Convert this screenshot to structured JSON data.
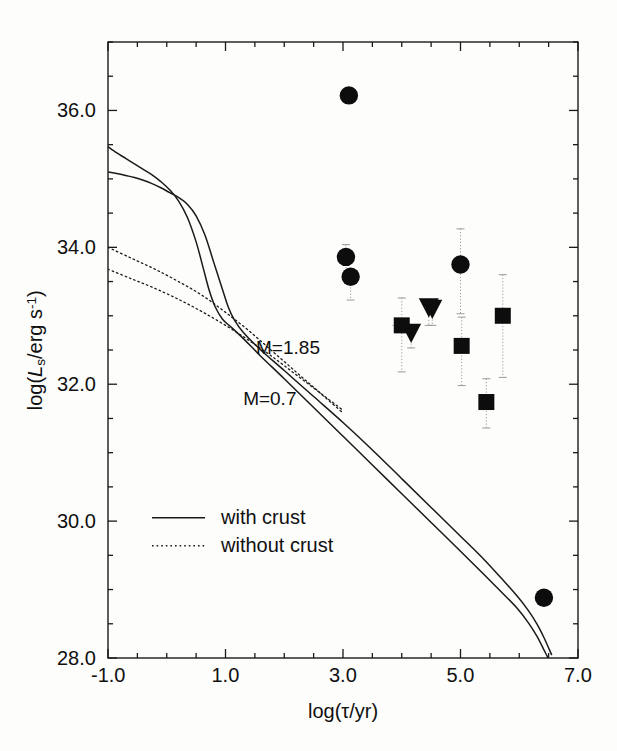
{
  "figure": {
    "background": "#fdfdfc",
    "ink": "#1a1a1a"
  },
  "axes": {
    "x_title": "log(τ/yr)",
    "y_title_prefix": "log(",
    "y_title_var": "L",
    "y_title_sub": "s",
    "y_title_mid": "/erg s",
    "y_title_sup": "-1",
    "y_title_suffix": ")",
    "x_ticks": [
      "-1.0",
      "1.0",
      "3.0",
      "5.0",
      "7.0"
    ],
    "y_ticks": [
      "28.0",
      "30.0",
      "32.0",
      "34.0",
      "36.0"
    ],
    "xlim": [
      -1.0,
      7.0
    ],
    "ylim": [
      28.0,
      37.0
    ],
    "x_major_step": 2.0,
    "y_major_step": 2.0,
    "x_minor_step": 0.5,
    "y_minor_step": 0.5
  },
  "curve_labels": {
    "upper": "M=1.85",
    "lower": "M=0.7"
  },
  "legend": {
    "entries": [
      {
        "label": "with crust",
        "style": "solid"
      },
      {
        "label": "without crust",
        "style": "dotted"
      }
    ]
  },
  "chart_data": {
    "type": "line",
    "title": "",
    "xlabel": "log(τ/yr)",
    "ylabel": "log(L_s/erg s^-1)",
    "xlim": [
      -1.0,
      7.0
    ],
    "ylim": [
      28.0,
      37.0
    ],
    "grid": false,
    "legend_position": "lower-left",
    "series": [
      {
        "name": "M=1.85 with crust",
        "style": "solid",
        "points": [
          [
            -1.0,
            35.47
          ],
          [
            -0.85,
            35.38
          ],
          [
            -0.7,
            35.3
          ],
          [
            -0.55,
            35.22
          ],
          [
            -0.4,
            35.14
          ],
          [
            -0.25,
            35.06
          ],
          [
            -0.1,
            34.96
          ],
          [
            0.05,
            34.84
          ],
          [
            0.2,
            34.68
          ],
          [
            0.35,
            34.44
          ],
          [
            0.5,
            34.08
          ],
          [
            0.62,
            33.7
          ],
          [
            0.72,
            33.38
          ],
          [
            0.82,
            33.14
          ],
          [
            0.95,
            32.95
          ],
          [
            1.1,
            32.83
          ],
          [
            1.3,
            32.67
          ],
          [
            1.6,
            32.41
          ],
          [
            2.0,
            32.08
          ],
          [
            2.5,
            31.66
          ],
          [
            3.0,
            31.24
          ],
          [
            3.5,
            30.82
          ],
          [
            4.0,
            30.4
          ],
          [
            4.5,
            29.98
          ],
          [
            5.0,
            29.56
          ],
          [
            5.4,
            29.22
          ],
          [
            5.7,
            28.96
          ],
          [
            5.95,
            28.74
          ],
          [
            6.15,
            28.52
          ],
          [
            6.3,
            28.32
          ],
          [
            6.42,
            28.12
          ],
          [
            6.52,
            27.95
          ]
        ]
      },
      {
        "name": "M=0.7 with crust",
        "style": "solid",
        "points": [
          [
            -1.0,
            35.1
          ],
          [
            -0.85,
            35.08
          ],
          [
            -0.7,
            35.05
          ],
          [
            -0.55,
            35.02
          ],
          [
            -0.4,
            34.98
          ],
          [
            -0.25,
            34.93
          ],
          [
            -0.1,
            34.87
          ],
          [
            0.05,
            34.8
          ],
          [
            0.2,
            34.73
          ],
          [
            0.35,
            34.63
          ],
          [
            0.5,
            34.46
          ],
          [
            0.65,
            34.18
          ],
          [
            0.8,
            33.78
          ],
          [
            0.95,
            33.38
          ],
          [
            1.05,
            33.12
          ],
          [
            1.15,
            32.94
          ],
          [
            1.3,
            32.76
          ],
          [
            1.6,
            32.5
          ],
          [
            2.0,
            32.2
          ],
          [
            2.5,
            31.82
          ],
          [
            3.0,
            31.44
          ],
          [
            3.5,
            31.04
          ],
          [
            4.0,
            30.62
          ],
          [
            4.5,
            30.2
          ],
          [
            5.0,
            29.78
          ],
          [
            5.4,
            29.44
          ],
          [
            5.7,
            29.16
          ],
          [
            5.95,
            28.92
          ],
          [
            6.15,
            28.7
          ],
          [
            6.3,
            28.5
          ],
          [
            6.42,
            28.3
          ],
          [
            6.55,
            28.05
          ]
        ]
      },
      {
        "name": "M=1.85 without crust",
        "style": "dotted",
        "points": [
          [
            -1.0,
            34.0
          ],
          [
            -0.6,
            33.84
          ],
          [
            -0.2,
            33.68
          ],
          [
            0.2,
            33.5
          ],
          [
            0.6,
            33.3
          ],
          [
            1.0,
            33.05
          ],
          [
            1.4,
            32.78
          ],
          [
            1.8,
            32.48
          ],
          [
            2.2,
            32.18
          ],
          [
            2.6,
            31.88
          ],
          [
            3.0,
            31.58
          ]
        ]
      },
      {
        "name": "M=0.7 without crust",
        "style": "dotted",
        "points": [
          [
            -1.0,
            33.68
          ],
          [
            -0.6,
            33.54
          ],
          [
            -0.2,
            33.4
          ],
          [
            0.2,
            33.24
          ],
          [
            0.6,
            33.06
          ],
          [
            1.0,
            32.86
          ],
          [
            1.4,
            32.64
          ],
          [
            1.8,
            32.4
          ],
          [
            2.2,
            32.14
          ],
          [
            2.6,
            31.88
          ],
          [
            3.0,
            31.62
          ]
        ]
      }
    ],
    "observations": [
      {
        "marker": "circle",
        "x": 3.1,
        "y": 36.22,
        "yerr_lo": 0.1,
        "yerr_hi": 0.04,
        "xerr": 0.03
      },
      {
        "marker": "circle",
        "x": 3.05,
        "y": 33.86,
        "yerr_lo": 0.3,
        "yerr_hi": 0.18,
        "xerr": 0.1
      },
      {
        "marker": "circle",
        "x": 3.13,
        "y": 33.57,
        "yerr_lo": 0.34,
        "yerr_hi": 0.08,
        "xerr": 0.08
      },
      {
        "marker": "circle",
        "x": 5.0,
        "y": 33.75,
        "yerr_lo": 0.72,
        "yerr_hi": 0.52,
        "xerr": 0.06
      },
      {
        "marker": "square",
        "x": 4.0,
        "y": 32.86,
        "yerr_lo": 0.68,
        "yerr_hi": 0.4,
        "xerr": 0.16
      },
      {
        "marker": "square",
        "x": 5.02,
        "y": 32.56,
        "yerr_lo": 0.58,
        "yerr_hi": 0.42,
        "xerr": 0.1
      },
      {
        "marker": "square",
        "x": 5.72,
        "y": 33.0,
        "yerr_lo": 0.9,
        "yerr_hi": 0.6,
        "xerr": 0.1
      },
      {
        "marker": "square",
        "x": 5.44,
        "y": 31.74,
        "yerr_lo": 0.38,
        "yerr_hi": 0.34,
        "xerr": 0.06
      },
      {
        "marker": "triangle",
        "x": 4.46,
        "y": 33.12,
        "yerr_lo": 0.26,
        "yerr_hi": 0.1,
        "xerr": 0.06
      },
      {
        "marker": "triangle",
        "x": 4.52,
        "y": 33.1,
        "yerr_lo": 0.24,
        "yerr_hi": 0.08,
        "xerr": 0.06
      },
      {
        "marker": "triangle",
        "x": 4.16,
        "y": 32.75,
        "yerr_lo": 0.22,
        "yerr_hi": 0.08,
        "xerr": 0.05
      },
      {
        "marker": "circle",
        "x": 6.42,
        "y": 28.88,
        "yerr_lo": 0.06,
        "yerr_hi": 0.06,
        "xerr": 0.04
      }
    ]
  }
}
